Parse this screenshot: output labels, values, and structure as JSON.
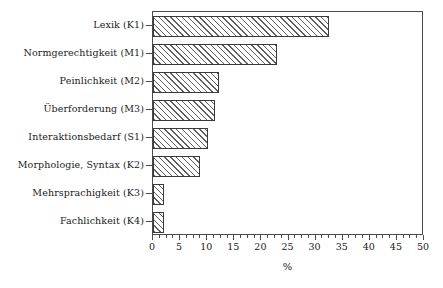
{
  "chart_data": {
    "type": "bar",
    "orientation": "horizontal",
    "title": "",
    "subtitle": "",
    "xlabel": "%",
    "ylabel": "",
    "xlim": [
      0,
      50
    ],
    "ylim": null,
    "grid": false,
    "legend": null,
    "legend_position": "none",
    "x_ticks": [
      0,
      5,
      10,
      15,
      20,
      25,
      30,
      35,
      40,
      45,
      50
    ],
    "x_tick_labels": [
      "0",
      "5",
      "10",
      "15",
      "20",
      "25",
      "30",
      "35",
      "40",
      "45",
      "50"
    ],
    "x_minor_tick_step": 1.25,
    "categories": [
      "Lexik (K1)",
      "Normgerechtigkeit (M1)",
      "Peinlichkeit (M2)",
      "Überforderung (M3)",
      "Interaktionsbedarf (S1)",
      "Morphologie, Syntax (K2)",
      "Mehrsprachigkeit (K3)",
      "Fachlichkeit (K4)"
    ],
    "values": [
      32.4,
      22.9,
      12.2,
      11.4,
      10.1,
      8.7,
      2.0,
      2.0
    ],
    "series": [
      {
        "name": "Anteil",
        "values": [
          32.4,
          22.9,
          12.2,
          11.4,
          10.1,
          8.7,
          2.0,
          2.0
        ]
      }
    ],
    "annotations": []
  },
  "style": {
    "bar_fill": "#ffffff",
    "bar_hatch": "diagonal-45",
    "bar_hatch_color": "#5c5c5c",
    "bar_edge_color": "#3a3a3a",
    "axis_color": "#4a4a4a",
    "text_color": "#1a1a1a",
    "background": "#ffffff"
  }
}
